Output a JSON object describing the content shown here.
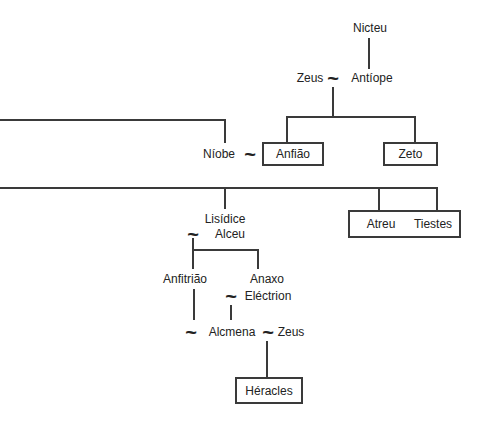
{
  "diagram_type": "family-tree",
  "colors": {
    "bg": "#ffffff",
    "line": "#3a3a3a",
    "text": "#222222"
  },
  "symbols": {
    "marriage": "~"
  },
  "people": {
    "nicteu": "Nicteu",
    "zeus_top": "Zeus",
    "antiope": "Antíope",
    "niobe": "Níobe",
    "anfiao": "Anfião",
    "zeto": "Zeto",
    "lisidice": "Lisídice",
    "alceu": "Alceu",
    "atreu": "Atreu",
    "tiestes": "Tiestes",
    "anfitriao": "Anfitrião",
    "anaxo": "Anaxo",
    "electrion": "Eléctrion",
    "alcmena": "Alcmena",
    "zeus_bottom": "Zeus",
    "heracles": "Héracles"
  }
}
